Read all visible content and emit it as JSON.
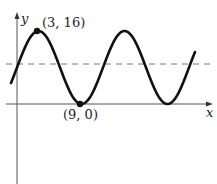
{
  "chart_data": {
    "type": "line",
    "title": "",
    "xlabel": "x",
    "ylabel": "y",
    "function_description": "sinusoid with maximum at (3, 16) and minimum at (9, 0); midline y = 8",
    "series": [
      {
        "name": "curve",
        "x": [
          0,
          3,
          6,
          9,
          12,
          15,
          18,
          21,
          23
        ],
        "y": [
          8,
          16,
          8,
          0,
          8,
          16,
          8,
          0,
          10
        ]
      }
    ],
    "midline": {
      "y": 8,
      "style": "dashed"
    },
    "points": [
      {
        "label": "(3, 16)",
        "x": 3,
        "y": 16
      },
      {
        "label": "(9, 0)",
        "x": 9,
        "y": 0
      }
    ],
    "grid": false
  },
  "labels": {
    "y_axis": "y",
    "x_axis": "x",
    "max_point": "(3, 16)",
    "min_point": "(9, 0)"
  }
}
